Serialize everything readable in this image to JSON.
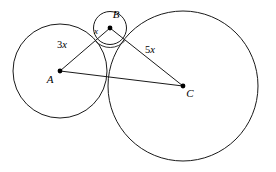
{
  "figure": {
    "background_color": "#ffffff",
    "stroke_color": "#1a1a1a",
    "label_color": "#000000",
    "width": 276,
    "height": 172
  },
  "circles": [
    {
      "id": "circle-a",
      "center_label": "A",
      "cx": 60,
      "cy": 71,
      "r": 47
    },
    {
      "id": "circle-b",
      "center_label": "B",
      "cx": 110,
      "cy": 28,
      "r": 16.5
    },
    {
      "id": "circle-c",
      "center_label": "C",
      "cx": 183,
      "cy": 86,
      "r": 75
    }
  ],
  "points": [
    {
      "id": "point-a",
      "label": "A",
      "x": 60,
      "y": 71,
      "label_x": 50,
      "label_y": 83
    },
    {
      "id": "point-b",
      "label": "B",
      "x": 110,
      "y": 28,
      "label_x": 116,
      "label_y": 18
    },
    {
      "id": "point-c",
      "label": "C",
      "x": 183,
      "y": 86,
      "label_x": 190,
      "label_y": 97
    }
  ],
  "segments": [
    {
      "id": "segment-ab",
      "from": "A",
      "to": "B",
      "label": "3x",
      "label_number": "3",
      "label_variable": "x",
      "label_x": 62,
      "label_y": 48
    },
    {
      "id": "segment-bc",
      "from": "B",
      "to": "C",
      "label": "5x",
      "label_number": "5",
      "label_variable": "x",
      "label_x": 150,
      "label_y": 53
    },
    {
      "id": "segment-ac",
      "from": "A",
      "to": "C",
      "label": "",
      "label_number": "",
      "label_variable": "",
      "label_x": 0,
      "label_y": 0
    }
  ],
  "angle_marks": [
    {
      "id": "angle-at-b",
      "vertex": "B",
      "label": "x",
      "label_x": 96,
      "label_y": 34
    }
  ]
}
